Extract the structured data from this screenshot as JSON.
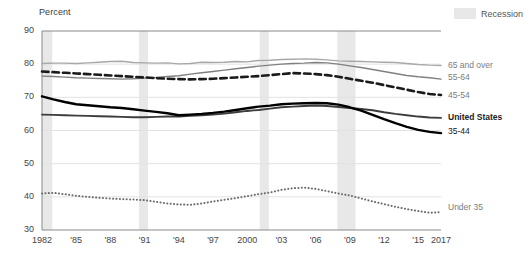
{
  "header": {
    "y_axis_title": "Percent",
    "legend": {
      "recession_label": "Recession",
      "recession_color": "#e8e8e8"
    }
  },
  "chart_data": {
    "type": "line",
    "title": "",
    "subtitle": "",
    "xlabel": "",
    "ylabel": "Percent",
    "ylim": [
      30,
      90
    ],
    "xlim": [
      1982,
      2017
    ],
    "grid": true,
    "legend_position": "right-inline",
    "yticks": [
      30,
      40,
      50,
      60,
      70,
      80,
      90
    ],
    "ytick_labels": [
      "30",
      "40",
      "50",
      "60",
      "70",
      "80",
      "90"
    ],
    "xticks": [
      1982,
      1985,
      1988,
      1991,
      1994,
      1997,
      2000,
      2003,
      2006,
      2009,
      2012,
      2015,
      2017
    ],
    "xtick_labels": [
      "1982",
      "'85",
      "'88",
      "'91",
      "'94",
      "'97",
      "2000",
      "'03",
      "'06",
      "'09",
      "'12",
      "'15",
      "2017"
    ],
    "x": [
      1982,
      1983,
      1984,
      1985,
      1986,
      1987,
      1988,
      1989,
      1990,
      1991,
      1992,
      1993,
      1994,
      1995,
      1996,
      1997,
      1998,
      1999,
      2000,
      2001,
      2002,
      2003,
      2004,
      2005,
      2006,
      2007,
      2008,
      2009,
      2010,
      2011,
      2012,
      2013,
      2014,
      2015,
      2016,
      2017
    ],
    "series": [
      {
        "name": "65 and over",
        "label": "65 and over",
        "color": "#a8a8a8",
        "style": "solid",
        "width": 1.4,
        "label_y": 79.3,
        "values": [
          80.2,
          80.3,
          80.3,
          80.2,
          80.4,
          80.6,
          80.8,
          80.9,
          80.5,
          80.4,
          80.3,
          80.4,
          80.1,
          80.2,
          80.6,
          80.5,
          80.6,
          80.8,
          80.7,
          81.1,
          81.2,
          81.4,
          81.5,
          81.6,
          81.5,
          81.3,
          81.0,
          80.9,
          80.8,
          80.7,
          80.6,
          80.5,
          80.2,
          79.9,
          79.7,
          79.6
        ]
      },
      {
        "name": "55-64",
        "label": "55-64",
        "color": "#808080",
        "style": "solid",
        "width": 1.4,
        "label_y": 75.7,
        "values": [
          76.4,
          76.3,
          76.1,
          75.9,
          75.8,
          75.7,
          75.6,
          75.5,
          75.6,
          75.8,
          76.0,
          76.3,
          76.5,
          77.0,
          77.4,
          77.8,
          78.2,
          78.6,
          79.0,
          79.4,
          79.7,
          80.0,
          80.2,
          80.3,
          80.5,
          80.4,
          80.0,
          79.5,
          79.0,
          78.4,
          77.8,
          77.2,
          76.6,
          76.2,
          75.9,
          75.5
        ]
      },
      {
        "name": "45-54",
        "label": "45-54",
        "color": "#1a1a1a",
        "style": "dashed",
        "width": 2.6,
        "label_y": 70.4,
        "values": [
          77.8,
          77.6,
          77.4,
          77.2,
          77.0,
          76.8,
          76.6,
          76.4,
          76.2,
          76.0,
          75.8,
          75.6,
          75.5,
          75.4,
          75.5,
          75.6,
          75.8,
          76.0,
          76.2,
          76.4,
          76.7,
          77.0,
          77.3,
          77.2,
          77.0,
          76.7,
          76.2,
          75.6,
          75.0,
          74.4,
          73.7,
          73.0,
          72.3,
          71.6,
          71.0,
          70.7
        ]
      },
      {
        "name": "United States",
        "label": "United States",
        "color": "#3d3d3d",
        "style": "solid",
        "width": 1.9,
        "label_y": 63.9,
        "values": [
          64.8,
          64.7,
          64.6,
          64.5,
          64.4,
          64.3,
          64.2,
          64.1,
          64.0,
          64.0,
          64.1,
          64.2,
          64.2,
          64.4,
          64.6,
          64.8,
          65.1,
          65.5,
          65.9,
          66.2,
          66.6,
          67.0,
          67.2,
          67.4,
          67.5,
          67.4,
          67.1,
          66.8,
          66.5,
          66.1,
          65.5,
          65.0,
          64.6,
          64.2,
          63.9,
          63.8
        ]
      },
      {
        "name": "35-44",
        "label": "35-44",
        "color": "#000000",
        "style": "solid",
        "width": 2.4,
        "label_y": 59.6,
        "values": [
          70.3,
          69.4,
          68.6,
          67.9,
          67.6,
          67.3,
          67.0,
          66.8,
          66.4,
          66.0,
          65.6,
          65.2,
          64.6,
          64.8,
          65.0,
          65.3,
          65.7,
          66.2,
          66.7,
          67.2,
          67.5,
          67.9,
          68.1,
          68.2,
          68.3,
          68.2,
          67.8,
          67.0,
          66.0,
          64.7,
          63.4,
          62.2,
          61.1,
          60.2,
          59.6,
          59.2
        ]
      },
      {
        "name": "Under 35",
        "label": "Under 35",
        "color": "#6b6b6b",
        "style": "dotted",
        "width": 2.0,
        "label_y": 36.6,
        "values": [
          41.0,
          41.2,
          40.8,
          40.3,
          40.0,
          39.7,
          39.5,
          39.3,
          39.2,
          39.0,
          38.5,
          38.0,
          37.7,
          37.6,
          38.0,
          38.6,
          39.1,
          39.6,
          40.2,
          40.8,
          41.3,
          42.1,
          42.6,
          42.8,
          42.4,
          41.7,
          41.0,
          40.4,
          39.5,
          38.6,
          37.8,
          37.0,
          36.3,
          35.7,
          35.2,
          35.4
        ]
      }
    ],
    "recessions": [
      {
        "start": 1982.0,
        "end": 1982.9
      },
      {
        "start": 1990.5,
        "end": 1991.3
      },
      {
        "start": 2001.1,
        "end": 2001.9
      },
      {
        "start": 2007.9,
        "end": 2009.5
      }
    ]
  }
}
